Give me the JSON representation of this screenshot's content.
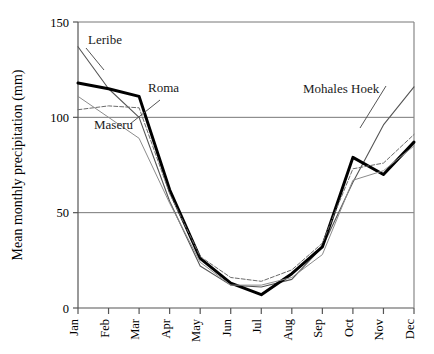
{
  "chart_data": {
    "type": "line",
    "title": "",
    "xlabel": "",
    "ylabel": "Mean monthly precipitation (mm)",
    "categories": [
      "Jan",
      "Feb",
      "Mar",
      "Apr",
      "May",
      "Jun",
      "Jul",
      "Aug",
      "Sep",
      "Oct",
      "Nov",
      "Dec"
    ],
    "ylim": [
      0,
      150
    ],
    "yticks": [
      0,
      50,
      100,
      150
    ],
    "ytick_labels": [
      "0",
      "50",
      "100",
      "150"
    ],
    "xlim_categories": 12,
    "grid": "horizontal-gridlines-at-50-100-150",
    "legend": "inline-annotations",
    "series": [
      {
        "name": "Leribe",
        "style": "thin-solid-grey",
        "color": "#555555",
        "width": 1.1,
        "dash": "none",
        "values": [
          137,
          115,
          100,
          56,
          22,
          12,
          11,
          15,
          32,
          66,
          96,
          116
        ]
      },
      {
        "name": "Roma",
        "style": "thick-solid-black",
        "color": "#000000",
        "width": 3.0,
        "dash": "none",
        "values": [
          118,
          115,
          111,
          62,
          26,
          13,
          7,
          18,
          32,
          79,
          70,
          87
        ]
      },
      {
        "name": "Maseru",
        "style": "thin-dashed-grey",
        "color": "#6b6b6b",
        "width": 1.0,
        "dash": "4 2",
        "values": [
          104,
          106,
          105,
          60,
          27,
          16,
          14,
          20,
          34,
          73,
          76,
          91
        ]
      },
      {
        "name": "Mohales Hoek",
        "style": "thin-solid-light-grey",
        "color": "#8c8c8c",
        "width": 1.0,
        "dash": "none",
        "values": [
          111,
          100,
          89,
          55,
          24,
          12,
          12,
          16,
          28,
          67,
          72,
          85
        ]
      }
    ],
    "annotations": [
      {
        "text": "Leribe",
        "x": 88,
        "y": 44,
        "anchor": "start",
        "leader": [
          [
            86,
            48
          ],
          [
            104,
            70
          ]
        ]
      },
      {
        "text": "Roma",
        "x": 148,
        "y": 92,
        "anchor": "start",
        "leader": []
      },
      {
        "text": "Maseru",
        "x": 94,
        "y": 129,
        "anchor": "start",
        "leader": [
          [
            130,
            124
          ],
          [
            160,
            100
          ]
        ]
      },
      {
        "text": "Mohales Hoek",
        "x": 303,
        "y": 93,
        "anchor": "start",
        "leader": [
          [
            386,
            86
          ],
          [
            360,
            128
          ]
        ]
      }
    ]
  },
  "plot_area": {
    "left": 78,
    "right": 414,
    "top": 22,
    "bottom": 308
  }
}
